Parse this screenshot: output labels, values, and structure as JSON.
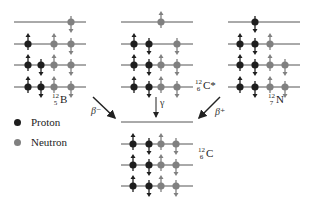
{
  "colors": {
    "proton": "#1e1e1e",
    "neutron": "#808080",
    "line": "#555555",
    "arrow": "#222222"
  },
  "nuclei": [
    {
      "id": "B12",
      "label": {
        "mass": "12",
        "atomic": "5",
        "symbol": "B"
      },
      "x0": 14,
      "x1": 86,
      "levels_y": [
        22,
        44,
        65,
        87
      ],
      "particles": [
        {
          "type": "neutron",
          "x": 71,
          "level": 0,
          "spin": "down"
        },
        {
          "type": "proton",
          "x": 28,
          "level": 1,
          "spin": "up"
        },
        {
          "type": "neutron",
          "x": 54,
          "level": 1,
          "spin": "up"
        },
        {
          "type": "neutron",
          "x": 71,
          "level": 1,
          "spin": "down"
        },
        {
          "type": "proton",
          "x": 28,
          "level": 2,
          "spin": "up"
        },
        {
          "type": "proton",
          "x": 41,
          "level": 2,
          "spin": "down"
        },
        {
          "type": "neutron",
          "x": 54,
          "level": 2,
          "spin": "up"
        },
        {
          "type": "neutron",
          "x": 71,
          "level": 2,
          "spin": "down"
        },
        {
          "type": "proton",
          "x": 28,
          "level": 3,
          "spin": "up"
        },
        {
          "type": "proton",
          "x": 41,
          "level": 3,
          "spin": "down"
        },
        {
          "type": "neutron",
          "x": 54,
          "level": 3,
          "spin": "up"
        },
        {
          "type": "neutron",
          "x": 71,
          "level": 3,
          "spin": "down"
        }
      ]
    },
    {
      "id": "C12star",
      "label": {
        "mass": "12",
        "atomic": "6",
        "symbol": "C*"
      },
      "x0": 121,
      "x1": 193,
      "levels_y": [
        22,
        44,
        65,
        87
      ],
      "particles": [
        {
          "type": "neutron",
          "x": 161,
          "level": 0,
          "spin": "up"
        },
        {
          "type": "proton",
          "x": 134,
          "level": 1,
          "spin": "up"
        },
        {
          "type": "proton",
          "x": 149,
          "level": 1,
          "spin": "down"
        },
        {
          "type": "neutron",
          "x": 177,
          "level": 1,
          "spin": "down"
        },
        {
          "type": "proton",
          "x": 134,
          "level": 2,
          "spin": "up"
        },
        {
          "type": "proton",
          "x": 149,
          "level": 2,
          "spin": "down"
        },
        {
          "type": "neutron",
          "x": 161,
          "level": 2,
          "spin": "up"
        },
        {
          "type": "neutron",
          "x": 177,
          "level": 2,
          "spin": "down"
        },
        {
          "type": "proton",
          "x": 134,
          "level": 3,
          "spin": "up"
        },
        {
          "type": "proton",
          "x": 149,
          "level": 3,
          "spin": "down"
        },
        {
          "type": "neutron",
          "x": 161,
          "level": 3,
          "spin": "up"
        },
        {
          "type": "neutron",
          "x": 177,
          "level": 3,
          "spin": "down"
        }
      ]
    },
    {
      "id": "N12",
      "label": {
        "mass": "12",
        "atomic": "7",
        "symbol": "N"
      },
      "x0": 228,
      "x1": 300,
      "levels_y": [
        22,
        44,
        65,
        87
      ],
      "particles": [
        {
          "type": "proton",
          "x": 255,
          "level": 0,
          "spin": "down"
        },
        {
          "type": "proton",
          "x": 240,
          "level": 1,
          "spin": "up"
        },
        {
          "type": "proton",
          "x": 255,
          "level": 1,
          "spin": "down"
        },
        {
          "type": "neutron",
          "x": 270,
          "level": 1,
          "spin": "up"
        },
        {
          "type": "proton",
          "x": 240,
          "level": 2,
          "spin": "up"
        },
        {
          "type": "proton",
          "x": 255,
          "level": 2,
          "spin": "down"
        },
        {
          "type": "neutron",
          "x": 270,
          "level": 2,
          "spin": "up"
        },
        {
          "type": "neutron",
          "x": 285,
          "level": 2,
          "spin": "down"
        },
        {
          "type": "proton",
          "x": 240,
          "level": 3,
          "spin": "up"
        },
        {
          "type": "proton",
          "x": 255,
          "level": 3,
          "spin": "down"
        },
        {
          "type": "neutron",
          "x": 270,
          "level": 3,
          "spin": "up"
        },
        {
          "type": "neutron",
          "x": 285,
          "level": 3,
          "spin": "down"
        }
      ]
    },
    {
      "id": "C12",
      "label": {
        "mass": "12",
        "atomic": "6",
        "symbol": "C"
      },
      "x0": 121,
      "x1": 193,
      "levels_y": [
        122,
        144,
        165,
        186
      ],
      "particles": [
        {
          "type": "proton",
          "x": 133,
          "level": 1,
          "spin": "up"
        },
        {
          "type": "proton",
          "x": 149,
          "level": 1,
          "spin": "down"
        },
        {
          "type": "neutron",
          "x": 161,
          "level": 1,
          "spin": "up"
        },
        {
          "type": "neutron",
          "x": 176,
          "level": 1,
          "spin": "down"
        },
        {
          "type": "proton",
          "x": 133,
          "level": 2,
          "spin": "up"
        },
        {
          "type": "proton",
          "x": 149,
          "level": 2,
          "spin": "down"
        },
        {
          "type": "neutron",
          "x": 161,
          "level": 2,
          "spin": "up"
        },
        {
          "type": "neutron",
          "x": 176,
          "level": 2,
          "spin": "down"
        },
        {
          "type": "proton",
          "x": 133,
          "level": 3,
          "spin": "up"
        },
        {
          "type": "proton",
          "x": 149,
          "level": 3,
          "spin": "down"
        },
        {
          "type": "neutron",
          "x": 161,
          "level": 3,
          "spin": "up"
        },
        {
          "type": "neutron",
          "x": 176,
          "level": 3,
          "spin": "down"
        }
      ]
    }
  ],
  "labels": {
    "b12": {
      "mass": "12",
      "atomic": "5",
      "symbol": "B"
    },
    "c12star": {
      "mass": "12",
      "atomic": "6",
      "symbol": "C*"
    },
    "n12": {
      "mass": "12",
      "atomic": "7",
      "symbol": "N"
    },
    "c12": {
      "mass": "12",
      "atomic": "6",
      "symbol": "C"
    }
  },
  "decays": {
    "beta_minus": "β⁻",
    "gamma": "γ",
    "beta_plus": "β⁺"
  },
  "legend": {
    "proton": "Proton",
    "neutron": "Neutron"
  }
}
